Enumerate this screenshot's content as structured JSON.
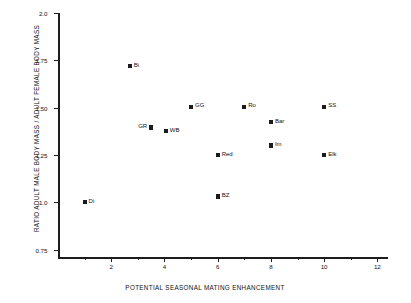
{
  "chart_data": {
    "type": "scatter",
    "title": "",
    "xlabel": "POTENTIAL SEASONAL MATING ENHANCEMENT",
    "ylabel": "RATIO ADULT MALE BODY MASS / ADULT FEMALE BODY MASS",
    "xlim": [
      0,
      12.4
    ],
    "ylim": [
      0.7,
      2.0
    ],
    "xticks": [
      2,
      4,
      6,
      8,
      10,
      12
    ],
    "xtick_labels": [
      "2",
      "4",
      "6",
      "8",
      "10",
      "12"
    ],
    "xticks_minor": [
      1,
      3,
      5,
      7,
      9,
      11
    ],
    "yticks": [
      0.75,
      1.0,
      1.25,
      1.5,
      1.75,
      2.0
    ],
    "ytick_labels": [
      "0.75",
      "1.0",
      "1.25",
      "1.50",
      "1.75",
      "2.0"
    ],
    "yticks_minor": [],
    "grid": false,
    "legend": null,
    "points": [
      {
        "label": "Di",
        "x": 1.0,
        "y": 1.0,
        "label_side": "right"
      },
      {
        "label": "Bi",
        "x": 2.7,
        "y": 1.72,
        "label_side": "right"
      },
      {
        "label": "GR",
        "x": 3.5,
        "y": 1.395,
        "label_side": "left"
      },
      {
        "label": "WB",
        "x": 4.05,
        "y": 1.375,
        "label_side": "right"
      },
      {
        "label": "GG",
        "x": 5.0,
        "y": 1.505,
        "label_side": "right"
      },
      {
        "label": "Red",
        "x": 6.0,
        "y": 1.25,
        "label_side": "right"
      },
      {
        "label": "BZ",
        "x": 6.0,
        "y": 1.03,
        "label_side": "right"
      },
      {
        "label": "Ro",
        "x": 7.0,
        "y": 1.505,
        "label_side": "right"
      },
      {
        "label": "Bar",
        "x": 8.0,
        "y": 1.425,
        "label_side": "right"
      },
      {
        "label": "Im",
        "x": 8.0,
        "y": 1.3,
        "label_side": "right"
      },
      {
        "label": "SS",
        "x": 10.0,
        "y": 1.505,
        "label_side": "right"
      },
      {
        "label": "Elk",
        "x": 10.0,
        "y": 1.25,
        "label_side": "right"
      }
    ]
  }
}
